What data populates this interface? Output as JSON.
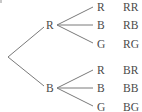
{
  "diagram": {
    "type": "tree-diagram",
    "root": {
      "x": 8,
      "y": 57
    },
    "first_level": [
      {
        "label": "R",
        "x": 50,
        "y": 25,
        "children": [
          {
            "label": "R",
            "y": 7,
            "outcome": "RR"
          },
          {
            "label": "B",
            "y": 25,
            "outcome": "RB"
          },
          {
            "label": "G",
            "y": 44,
            "outcome": "RG"
          }
        ]
      },
      {
        "label": "B",
        "x": 50,
        "y": 88,
        "children": [
          {
            "label": "R",
            "y": 70,
            "outcome": "BR"
          },
          {
            "label": "B",
            "y": 88,
            "outcome": "BB"
          },
          {
            "label": "G",
            "y": 107,
            "outcome": "BG"
          }
        ]
      }
    ],
    "colors": {
      "line": "#7a7a7a",
      "text": "#4a4a4a",
      "background": "#ffffff"
    }
  },
  "labels": {
    "n1": "R",
    "n2": "B",
    "n1_1": "R",
    "n1_2": "B",
    "n1_3": "G",
    "n2_1": "R",
    "n2_2": "B",
    "n2_3": "G",
    "o1_1": "RR",
    "o1_2": "RB",
    "o1_3": "RG",
    "o2_1": "BR",
    "o2_2": "BB",
    "o2_3": "BG"
  }
}
